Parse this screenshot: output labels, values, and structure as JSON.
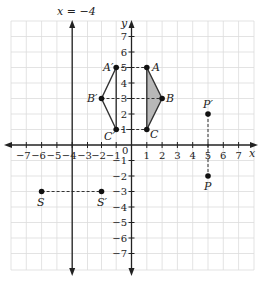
{
  "figure": {
    "type": "coordinate-plane-reflection",
    "x_range": [
      -7,
      7
    ],
    "y_range": [
      -7,
      7
    ],
    "axis_labels": {
      "x": "x",
      "y": "y"
    },
    "x_ticks": [
      "-7",
      "-6",
      "-5",
      "-4",
      "-3",
      "-2",
      "-1",
      "1",
      "2",
      "3",
      "4",
      "5",
      "6",
      "7"
    ],
    "y_ticks": [
      "7",
      "6",
      "5",
      "4",
      "3",
      "2",
      "1",
      "-1",
      "-2",
      "-3",
      "-4",
      "-5",
      "-6",
      "-7"
    ],
    "origin_label": "0",
    "line_of_reflection": {
      "label": "x = −4",
      "x": -4
    },
    "shaded_color": "#b8b8b8",
    "points": [
      {
        "name": "A",
        "x": 1,
        "y": 5
      },
      {
        "name": "B",
        "x": 2,
        "y": 3
      },
      {
        "name": "C",
        "x": 1,
        "y": 1
      },
      {
        "name": "A′",
        "x": -1,
        "y": 5
      },
      {
        "name": "B′",
        "x": -2,
        "y": 3
      },
      {
        "name": "C′",
        "x": -1,
        "y": 1
      },
      {
        "name": "P",
        "x": 5,
        "y": -2
      },
      {
        "name": "P′",
        "x": 5,
        "y": 2
      },
      {
        "name": "S",
        "x": -6,
        "y": -3
      },
      {
        "name": "S′",
        "x": -2,
        "y": -3
      }
    ]
  },
  "labels": {
    "x_axis": "x",
    "y_axis": "y",
    "origin": "0",
    "reflection_line": "x = −4",
    "A": "A",
    "B": "B",
    "C": "C",
    "A_prime": "A′",
    "B_prime": "B′",
    "C_prime": "C′",
    "P": "P",
    "P_prime": "P′",
    "S": "S",
    "S_prime": "S′",
    "xt": [
      "−7",
      "−6",
      "−5",
      "−4",
      "−3",
      "−2",
      "−1",
      "1",
      "2",
      "3",
      "4",
      "5",
      "6",
      "7"
    ],
    "yt": [
      "7",
      "6",
      "5",
      "4",
      "3",
      "2",
      "1",
      "−1",
      "−2",
      "−3",
      "−4",
      "−5",
      "−6",
      "−7"
    ]
  }
}
